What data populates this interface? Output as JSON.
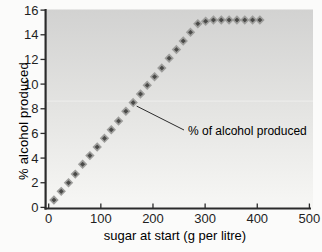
{
  "figure": {
    "annotation": {
      "text": "% of alcohol produced"
    }
  },
  "chart_data": {
    "type": "scatter",
    "marker": "diamond",
    "title": "",
    "xlabel": "sugar at start (g per litre)",
    "ylabel": "% alcohol produced",
    "xlim": [
      0,
      500
    ],
    "ylim": [
      0,
      16
    ],
    "x_ticks": [
      0,
      100,
      200,
      300,
      400,
      500
    ],
    "y_ticks": [
      0,
      2,
      4,
      6,
      8,
      10,
      12,
      14,
      16
    ],
    "grid": false,
    "legend": "none",
    "annotation_text": "% of alcohol produced",
    "annotation_target_point_index": 11,
    "series": [
      {
        "name": "% of alcohol produced",
        "points": [
          [
            10,
            0.6
          ],
          [
            24,
            1.3
          ],
          [
            38,
            2.0
          ],
          [
            51,
            2.7
          ],
          [
            65,
            3.5
          ],
          [
            79,
            4.2
          ],
          [
            93,
            4.9
          ],
          [
            107,
            5.6
          ],
          [
            120,
            6.3
          ],
          [
            134,
            7.0
          ],
          [
            148,
            7.8
          ],
          [
            162,
            8.5
          ],
          [
            176,
            9.2
          ],
          [
            189,
            9.9
          ],
          [
            203,
            10.6
          ],
          [
            217,
            11.3
          ],
          [
            231,
            12.1
          ],
          [
            245,
            12.8
          ],
          [
            258,
            13.5
          ],
          [
            272,
            14.2
          ],
          [
            286,
            14.9
          ],
          [
            301,
            15.1
          ],
          [
            316,
            15.2
          ],
          [
            331,
            15.2
          ],
          [
            346,
            15.2
          ],
          [
            361,
            15.2
          ],
          [
            376,
            15.2
          ],
          [
            391,
            15.2
          ],
          [
            405,
            15.2
          ]
        ]
      }
    ]
  },
  "colors": {
    "marker_fill": "#4a4a48",
    "marker_halo": "#9e9e9c",
    "axis": "#2b2b2b",
    "text": "#1f1f1f",
    "plot_bg_top": "#d2d2d1",
    "plot_bg_mid": "#e4e4e2",
    "plot_bg_bottom": "#f7f7f5",
    "page_bg": "#fbfbfa"
  }
}
